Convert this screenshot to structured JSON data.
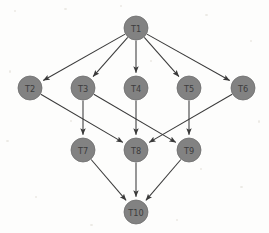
{
  "diagram": {
    "type": "directed-acyclic-graph",
    "background_color": "#fdfdfc",
    "node_fill_color": "#828282",
    "node_stroke_color": "#6e6e6e",
    "node_label_color": "#3c3c3c",
    "edge_color": "#3a3a3a",
    "node_radius": 12,
    "width": 269,
    "height": 233,
    "nodes": [
      {
        "id": "T1",
        "label": "T1",
        "x": 136,
        "y": 28,
        "level": 0
      },
      {
        "id": "T2",
        "label": "T2",
        "x": 30,
        "y": 88,
        "level": 1
      },
      {
        "id": "T3",
        "label": "T3",
        "x": 83,
        "y": 88,
        "level": 1
      },
      {
        "id": "T4",
        "label": "T4",
        "x": 136,
        "y": 88,
        "level": 1
      },
      {
        "id": "T5",
        "label": "T5",
        "x": 189,
        "y": 88,
        "level": 1
      },
      {
        "id": "T6",
        "label": "T6",
        "x": 243,
        "y": 88,
        "level": 1
      },
      {
        "id": "T7",
        "label": "T7",
        "x": 83,
        "y": 150,
        "level": 2
      },
      {
        "id": "T8",
        "label": "T8",
        "x": 136,
        "y": 150,
        "level": 2
      },
      {
        "id": "T9",
        "label": "T9",
        "x": 189,
        "y": 150,
        "level": 2
      },
      {
        "id": "T10",
        "label": "T10",
        "x": 136,
        "y": 212,
        "level": 3
      }
    ],
    "edges": [
      {
        "from": "T1",
        "to": "T2"
      },
      {
        "from": "T1",
        "to": "T3"
      },
      {
        "from": "T1",
        "to": "T4"
      },
      {
        "from": "T1",
        "to": "T5"
      },
      {
        "from": "T1",
        "to": "T6"
      },
      {
        "from": "T2",
        "to": "T8"
      },
      {
        "from": "T3",
        "to": "T7"
      },
      {
        "from": "T3",
        "to": "T9"
      },
      {
        "from": "T4",
        "to": "T8"
      },
      {
        "from": "T5",
        "to": "T9"
      },
      {
        "from": "T6",
        "to": "T8"
      },
      {
        "from": "T7",
        "to": "T10"
      },
      {
        "from": "T8",
        "to": "T10"
      },
      {
        "from": "T9",
        "to": "T10"
      }
    ]
  }
}
